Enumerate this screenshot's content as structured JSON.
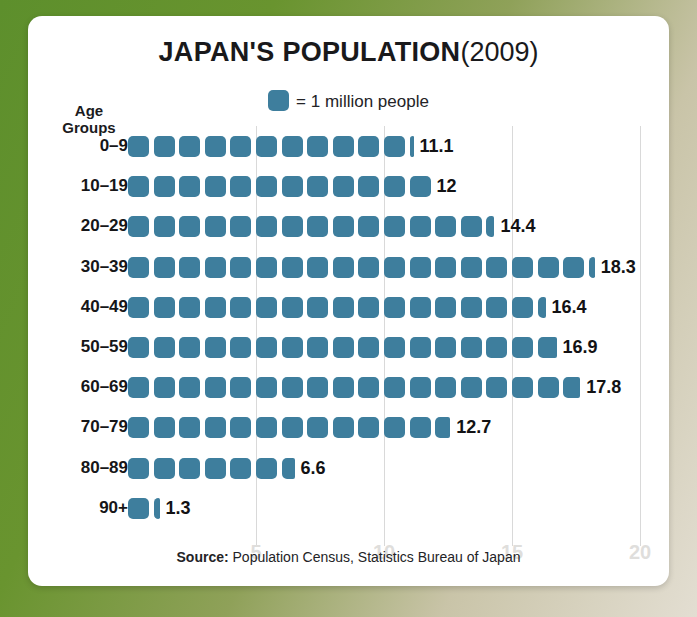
{
  "title": {
    "main": "JAPAN'S POPULATION",
    "year": "(2009)"
  },
  "legend": {
    "swatch_name": "blue-rounded-square",
    "text": "= 1 million people"
  },
  "axis_heading": {
    "line1": "Age",
    "line2": "Groups"
  },
  "source": {
    "label": "Source:",
    "text": " Population Census, Statistics Bureau of Japan"
  },
  "colors": {
    "icon_blue": "#3e7e9d",
    "card_background": "#ffffff",
    "page_green": "#6f9434",
    "gridline": "#d9d9d9",
    "gridlabel": "#dfdedc",
    "text_dark": "#161618"
  },
  "chart_data": {
    "type": "bar",
    "subtype": "pictogram",
    "subtitle": "= 1 million people",
    "xlabel": "",
    "ylabel": "Age Groups",
    "unit": "million people",
    "unit_per_icon": 1,
    "xlim": [
      0,
      20.6
    ],
    "xticks": [
      5,
      10,
      15,
      20
    ],
    "xticklabels": [
      "5",
      "10",
      "15",
      "20"
    ],
    "grid": true,
    "legend_position": "top-center",
    "categories": [
      "0–9",
      "10–19",
      "20–29",
      "30–39",
      "40–49",
      "50–59",
      "60–69",
      "70–79",
      "80–89",
      "90+"
    ],
    "values": [
      11.1,
      12,
      14.4,
      18.3,
      16.4,
      16.9,
      17.8,
      12.7,
      6.6,
      1.3
    ],
    "value_labels": [
      "11.1",
      "12",
      "14.4",
      "18.3",
      "16.4",
      "16.9",
      "17.8",
      "12.7",
      "6.6",
      "1.3"
    ],
    "source": "Source: Population Census, Statistics Bureau of Japan"
  }
}
